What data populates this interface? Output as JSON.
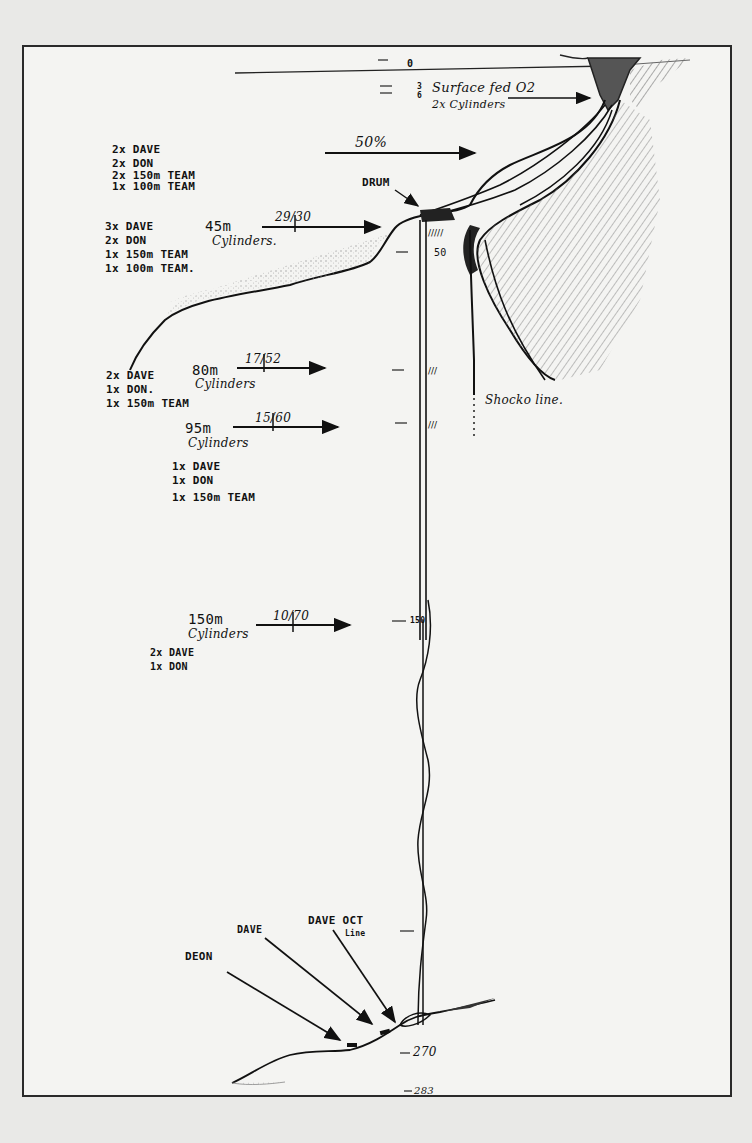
{
  "diagram": {
    "type": "hand-drawn dive plan / cave shaft cross-section",
    "surface": {
      "depth_marks": [
        "0",
        "3",
        "6"
      ],
      "label_line1": "Surface fed O2",
      "label_line2": "2x Cylinders"
    },
    "arrows": {
      "gas_50": "50%",
      "gas_45m": "29/30",
      "gas_80m": "17/52",
      "gas_95m": "15/60",
      "gas_150m": "10/70"
    },
    "labels": {
      "drum": "DRUM",
      "shock_line": "Shocko line.",
      "deon": "DEON",
      "dave": "DAVE",
      "dave_oct_line1": "DAVE OCT",
      "dave_oct_line2": "Line"
    },
    "stages": [
      {
        "name": "stage-50pct",
        "items": [
          "2x DAVE",
          "2x DON",
          "2x 150m TEAM",
          "1x 100m TEAM"
        ]
      },
      {
        "name": "stage-45m",
        "depth_label": "45m",
        "sub_label": "Cylinders.",
        "items": [
          "3x DAVE",
          "2x DON",
          "1x 150m TEAM",
          "1x 100m TEAM."
        ]
      },
      {
        "name": "stage-80m",
        "depth_label": "80m",
        "sub_label": "Cylinders",
        "items": [
          "2x DAVE",
          "1x DON.",
          "1x 150m TEAM"
        ]
      },
      {
        "name": "stage-95m",
        "depth_label": "95m",
        "sub_label": "Cylinders",
        "items": [
          "1x DAVE",
          "1x DON",
          "1x 150m TEAM"
        ]
      },
      {
        "name": "stage-150m",
        "depth_label": "150m",
        "sub_label": "Cylinders",
        "items": [
          "2x DAVE",
          "1x DON"
        ]
      }
    ],
    "shot_line_marks": {
      "m50": "50",
      "m150": "150"
    },
    "bottom_depths": {
      "d270": "270",
      "d283": "283"
    },
    "colors": {
      "paper": "#f4f4f2",
      "ink": "#111111",
      "shading": "#8a8a8a",
      "border": "#2a2a2a"
    }
  }
}
